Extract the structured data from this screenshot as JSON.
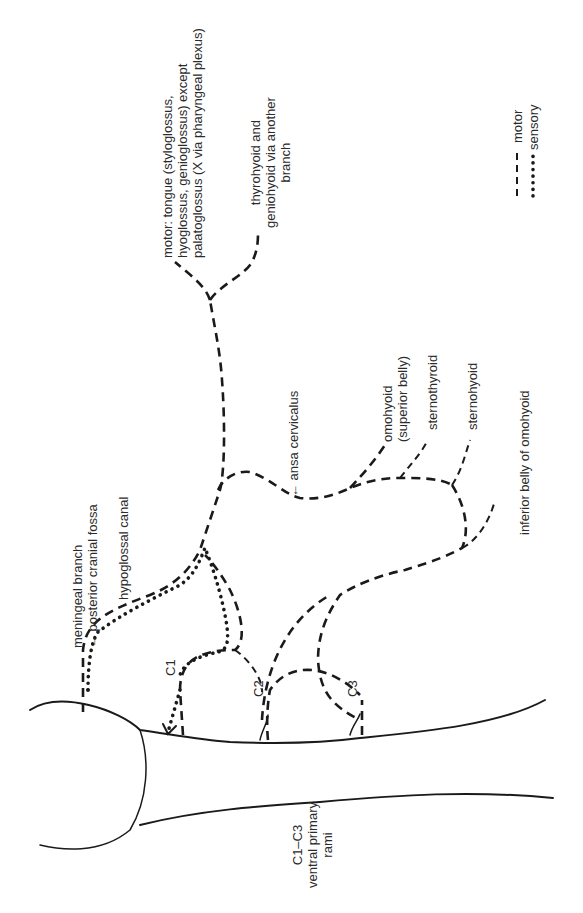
{
  "diagram": {
    "orientation": "rotated 90° counter-clockwise",
    "legend": {
      "items": [
        {
          "style": "dashed",
          "label": "motor"
        },
        {
          "style": "dotted",
          "label": "sensory"
        }
      ]
    },
    "labels": {
      "meningeal_branch": "meningeal branch\n→ posterior cranial fossa",
      "hypoglossal_canal": "hypoglossal canal",
      "c1": "C1",
      "c2": "C2",
      "c3": "C3",
      "ventral_rami": "C1–C3\nventral primary\nrami",
      "tongue_motor": "motor: tongue (styloglossus,\nhyoglossus, genioglossus) except\npalatoglossus (X via pharyngeal plexus)",
      "thyrohyoid": "thyrohyoid and\ngeniohyoid via another\nbranch",
      "ansa_cervicalis": "← ansa cervicalus",
      "omohyoid_superior": "omohyoid\n(superior belly)",
      "sternothyroid": "sternothyroid",
      "sternohyoid": "sternohyoid",
      "omohyoid_inferior": "inferior belly of omohyoid"
    },
    "colors": {
      "line": "#1a1a1a",
      "text": "#2b2b2b",
      "background": "#ffffff"
    }
  }
}
